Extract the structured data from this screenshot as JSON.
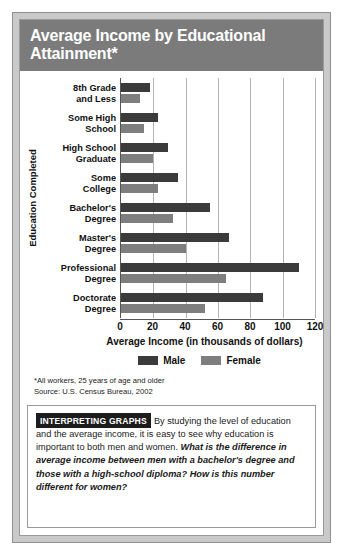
{
  "figure": {
    "title": "Average Income by Educational Attainment*",
    "footnote": "*All workers, 25 years of age and older",
    "source": "Source: U.S. Census Bureau, 2002"
  },
  "interpreting": {
    "tag": "INTERPRETING GRAPHS",
    "intro": "By studying the level of education and the average income, it is easy to see why education is important to both men and women.",
    "question": "What is the difference in average income between men with a bachelor's degree and those with a high-school diploma? How is this number different for women?"
  },
  "colors": {
    "male": "#3b3b3b",
    "female": "#7e7e7e",
    "title_band": "#7b7b7b",
    "frame": "#c9c9c9",
    "gridline": "#b4b4b4",
    "axis": "#555555"
  },
  "chart_data": {
    "type": "bar",
    "orientation": "horizontal",
    "title": "Average Income by Educational Attainment*",
    "xlabel": "Average Income (in thousands of dollars)",
    "ylabel": "Education Completed",
    "xlim": [
      0,
      120
    ],
    "xticks": [
      0,
      20,
      40,
      60,
      80,
      100,
      120
    ],
    "grid": true,
    "legend_position": "bottom",
    "categories": [
      "8th Grade and Less",
      "Some High School",
      "High School Graduate",
      "Some College",
      "Bachelor's Degree",
      "Master's Degree",
      "Professional Degree",
      "Doctorate Degree"
    ],
    "category_lines": [
      [
        "8th Grade",
        "and Less"
      ],
      [
        "Some High",
        "School"
      ],
      [
        "High School",
        "Graduate"
      ],
      [
        "Some",
        "College"
      ],
      [
        "Bachelor's",
        "Degree"
      ],
      [
        "Master's",
        "Degree"
      ],
      [
        "Professional",
        "Degree"
      ],
      [
        "Doctorate",
        "Degree"
      ]
    ],
    "series": [
      {
        "name": "Male",
        "values": [
          18,
          23,
          29,
          35,
          55,
          67,
          110,
          88
        ]
      },
      {
        "name": "Female",
        "values": [
          12,
          14,
          20,
          23,
          32,
          40,
          65,
          52
        ]
      }
    ]
  }
}
